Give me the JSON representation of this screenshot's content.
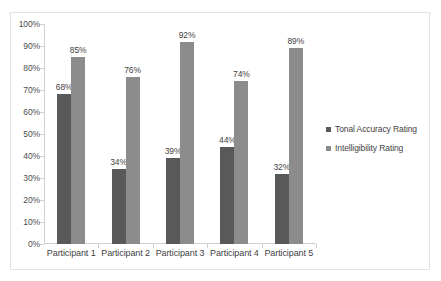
{
  "chart_data": {
    "type": "bar",
    "title": "",
    "subtitle": "",
    "xlabel": "",
    "ylabel": "",
    "categories": [
      "Participant 1",
      "Participant 2",
      "Participant 3",
      "Participant 4",
      "Participant 5"
    ],
    "series": [
      {
        "name": "Tonal Accuracy Rating",
        "color": "#595959",
        "values": [
          68,
          34,
          39,
          44,
          32
        ],
        "labels": [
          "68%",
          "34%",
          "39%",
          "44%",
          "32%"
        ]
      },
      {
        "name": "Intelligibility Rating",
        "color": "#8c8c8c",
        "values": [
          85,
          76,
          92,
          74,
          89
        ],
        "labels": [
          "85%",
          "76%",
          "92%",
          "74%",
          "89%"
        ]
      }
    ],
    "ylim": [
      0,
      100
    ],
    "ytick_values": [
      0,
      10,
      20,
      30,
      40,
      50,
      60,
      70,
      80,
      90,
      100
    ],
    "ytick_labels": [
      "0%",
      "10%",
      "20%",
      "30%",
      "40%",
      "50%",
      "60%",
      "70%",
      "80%",
      "90%",
      "100%"
    ],
    "grid": false,
    "legend_position": "right",
    "data_labels_shown": true
  },
  "legend": {
    "items": [
      {
        "label": "Tonal Accuracy Rating"
      },
      {
        "label": "Intelligibility Rating"
      }
    ]
  }
}
